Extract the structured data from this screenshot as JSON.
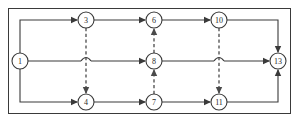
{
  "diagram": {
    "type": "activity-network",
    "canvas": {
      "width": 299,
      "height": 122
    },
    "frame": {
      "x": 8,
      "y": 8,
      "width": 283,
      "height": 106
    },
    "colors": {
      "stroke": "#3a3a3a",
      "dashed_stroke": "#4a4a4a",
      "node_fill": "#ffffff",
      "label": "#2a2a2a",
      "background": "#ffffff"
    },
    "node_radius": 8,
    "nodes": [
      {
        "id": "n1",
        "label": "1",
        "cx": 20,
        "cy": 61,
        "row": "middle"
      },
      {
        "id": "n3",
        "label": "3",
        "cx": 86,
        "cy": 20,
        "row": "top"
      },
      {
        "id": "n6",
        "label": "6",
        "cx": 154,
        "cy": 20,
        "row": "top"
      },
      {
        "id": "n10",
        "label": "10",
        "cx": 219,
        "cy": 20,
        "row": "top"
      },
      {
        "id": "n8",
        "label": "8",
        "cx": 154,
        "cy": 61,
        "row": "middle"
      },
      {
        "id": "n4",
        "label": "4",
        "cx": 86,
        "cy": 102,
        "row": "bottom"
      },
      {
        "id": "n7",
        "label": "7",
        "cx": 154,
        "cy": 102,
        "row": "bottom"
      },
      {
        "id": "n11",
        "label": "11",
        "cx": 219,
        "cy": 102,
        "row": "bottom"
      },
      {
        "id": "n13",
        "label": "13",
        "cx": 278,
        "cy": 61,
        "row": "middle"
      }
    ],
    "edges_solid": [
      {
        "id": "e1-3",
        "from": "1",
        "to": "3",
        "style": "solid",
        "path": "M 20 53 L 20 20 L 78 20",
        "arrow_at": {
          "x": 78,
          "y": 20,
          "dir": "right"
        }
      },
      {
        "id": "e1-8",
        "from": "1",
        "to": "8",
        "style": "solid",
        "path": "M 28 61 L 146 61",
        "arrow_at": {
          "x": 146,
          "y": 61,
          "dir": "right"
        }
      },
      {
        "id": "e1-4",
        "from": "1",
        "to": "4",
        "style": "solid",
        "path": "M 20 69 L 20 102 L 78 102",
        "arrow_at": {
          "x": 78,
          "y": 102,
          "dir": "right"
        }
      },
      {
        "id": "e3-6",
        "from": "3",
        "to": "6",
        "style": "solid",
        "path": "M 94 20 L 146 20",
        "arrow_at": {
          "x": 146,
          "y": 20,
          "dir": "right"
        }
      },
      {
        "id": "e6-10",
        "from": "6",
        "to": "10",
        "style": "solid",
        "path": "M 162 20 L 211 20",
        "arrow_at": {
          "x": 211,
          "y": 20,
          "dir": "right"
        }
      },
      {
        "id": "e8-13",
        "from": "8",
        "to": "13",
        "style": "solid",
        "path": "M 162 61 L 270 61",
        "arrow_at": {
          "x": 270,
          "y": 61,
          "dir": "right"
        }
      },
      {
        "id": "e4-7",
        "from": "4",
        "to": "7",
        "style": "solid",
        "path": "M 94 102 L 146 102",
        "arrow_at": {
          "x": 146,
          "y": 102,
          "dir": "right"
        }
      },
      {
        "id": "e7-11",
        "from": "7",
        "to": "11",
        "style": "solid",
        "path": "M 162 102 L 211 102",
        "arrow_at": {
          "x": 211,
          "y": 102,
          "dir": "right"
        }
      },
      {
        "id": "e10-13",
        "from": "10",
        "to": "13",
        "style": "solid",
        "path": "M 227 20 L 278 20 L 278 53",
        "arrow_at": {
          "x": 278,
          "y": 53,
          "dir": "down"
        }
      },
      {
        "id": "e11-13",
        "from": "11",
        "to": "13",
        "style": "solid",
        "path": "M 227 102 L 278 102 L 278 69",
        "arrow_at": {
          "x": 278,
          "y": 69,
          "dir": "up"
        }
      }
    ],
    "edges_dashed": [
      {
        "id": "d3-4",
        "from": "3",
        "to": "4",
        "style": "dashed",
        "path": "M 86 28 L 86 94",
        "arrow_at": {
          "x": 86,
          "y": 94,
          "dir": "down"
        },
        "crosses": "e1-8"
      },
      {
        "id": "d8-6",
        "from": "8",
        "to": "6",
        "style": "dashed",
        "path": "M 154 53 L 154 28",
        "arrow_at": {
          "x": 154,
          "y": 28,
          "dir": "up"
        },
        "crosses": null
      },
      {
        "id": "d7-8",
        "from": "7",
        "to": "8",
        "style": "dashed",
        "path": "M 154 94 L 154 69",
        "arrow_at": {
          "x": 154,
          "y": 69,
          "dir": "up"
        },
        "crosses": null
      },
      {
        "id": "d10-11",
        "from": "10",
        "to": "11",
        "style": "dashed",
        "path": "M 219 28 L 219 94",
        "arrow_at": {
          "x": 219,
          "y": 94,
          "dir": "down"
        },
        "crosses": "e8-13"
      }
    ],
    "line_hops": [
      {
        "id": "hop-left",
        "cx": 86,
        "cy": 61,
        "radius": 5,
        "on_edge": "e1-8",
        "over": "d3-4"
      },
      {
        "id": "hop-right",
        "cx": 219,
        "cy": 61,
        "radius": 5,
        "on_edge": "e8-13",
        "over": "d10-11"
      }
    ]
  }
}
